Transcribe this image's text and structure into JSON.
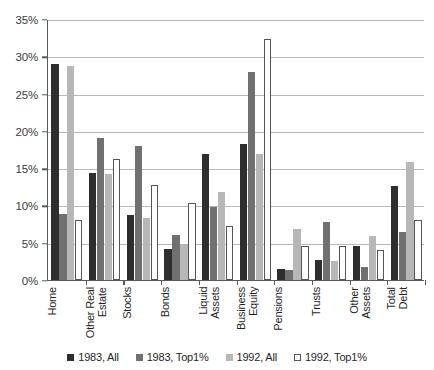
{
  "chart_data": {
    "type": "bar",
    "title": "",
    "xlabel": "",
    "ylabel": "",
    "ylim": [
      0,
      35
    ],
    "ytick_values": [
      0,
      5,
      10,
      15,
      20,
      25,
      30,
      35
    ],
    "ytick_labels": [
      "0%",
      "5%",
      "10%",
      "15%",
      "20%",
      "25%",
      "30%",
      "35%"
    ],
    "grid": true,
    "legend_position": "bottom",
    "categories": [
      "Home",
      "Other Real\nEstate",
      "Stocks",
      "Bonds",
      "Liquid\nAssets",
      "Business\nEquity",
      "Pensions",
      "Trusts",
      "Other\nAssets",
      "Total\nDebt"
    ],
    "series": [
      {
        "name": "1983, All",
        "color": "#2e2e2e",
        "values": [
          29.0,
          14.3,
          8.7,
          4.2,
          16.9,
          18.3,
          1.5,
          2.7,
          4.5,
          12.6
        ]
      },
      {
        "name": "1983, Top1%",
        "color": "#707070",
        "values": [
          8.8,
          19.0,
          18.0,
          6.0,
          9.8,
          27.9,
          1.3,
          7.8,
          1.8,
          6.4
        ]
      },
      {
        "name": "1992, All",
        "color": "#b7b7b7",
        "values": [
          28.7,
          14.2,
          8.3,
          4.8,
          11.8,
          16.9,
          6.9,
          2.5,
          5.9,
          15.8
        ]
      },
      {
        "name": "1992, Top1%",
        "color": "#ffffff",
        "values": [
          8.0,
          16.2,
          12.7,
          10.3,
          7.2,
          32.3,
          4.6,
          4.5,
          4.0,
          8.0
        ]
      }
    ]
  },
  "axis": {
    "line_color": "#5a5a5a",
    "grid_color": "#b9b9b9"
  }
}
